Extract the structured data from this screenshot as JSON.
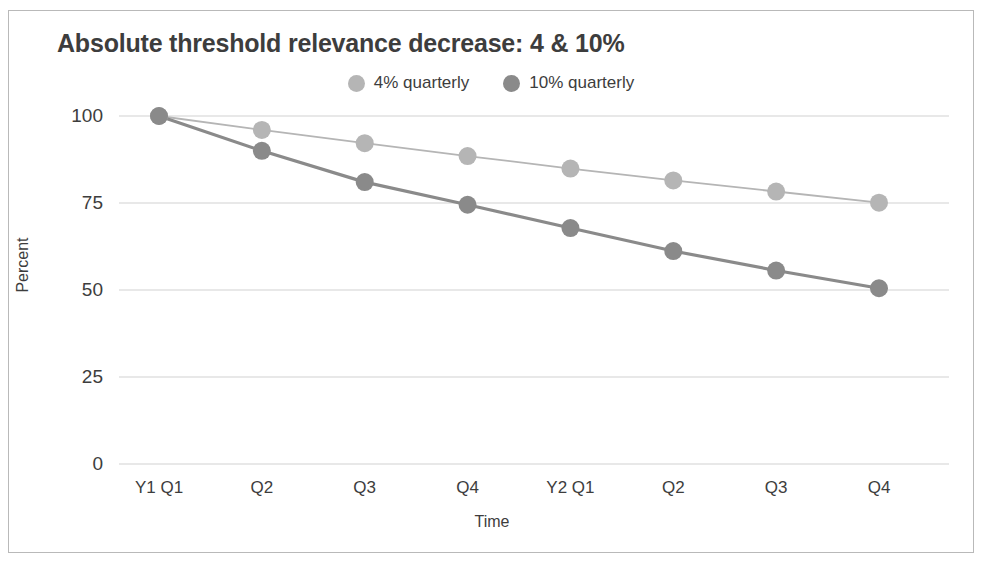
{
  "figure": {
    "border_color": "#b9b9b9",
    "background": "#ffffff"
  },
  "chart_data": {
    "type": "line",
    "title": "Absolute threshold relevance decrease: 4 & 10%",
    "xlabel": "Time",
    "ylabel": "Percent",
    "categories": [
      "Y1 Q1",
      "Q2",
      "Q3",
      "Q4",
      "Y2 Q1",
      "Q2",
      "Q3",
      "Q4"
    ],
    "series": [
      {
        "name": "4% quarterly",
        "color": "#b5b5b5",
        "values": [
          100,
          96,
          92.2,
          88.5,
          84.9,
          81.5,
          78.3,
          75.1
        ]
      },
      {
        "name": "10% quarterly",
        "color": "#8a8a8a",
        "values": [
          100,
          90,
          81,
          74.5,
          67.8,
          61.2,
          55.6,
          50.5
        ]
      }
    ],
    "ylim": [
      0,
      100
    ],
    "yticks": [
      0,
      25,
      50,
      75,
      100
    ],
    "ytick_labels": [
      "0",
      "25",
      "50",
      "75",
      "100"
    ],
    "grid": true,
    "gridline_color": "#d2d2d2",
    "legend_position": "top-center"
  }
}
